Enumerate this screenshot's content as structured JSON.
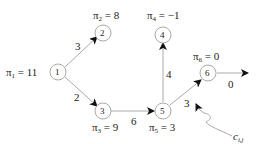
{
  "nodes": [
    {
      "id": "1",
      "label": "1",
      "potential": "π",
      "potential_sub": "1",
      "potential_value": "= 11"
    },
    {
      "id": "2",
      "label": "2",
      "potential": "π",
      "potential_sub": "2",
      "potential_value": "= 8"
    },
    {
      "id": "3",
      "label": "3",
      "potential": "π",
      "potential_sub": "3",
      "potential_value": "= 9"
    },
    {
      "id": "4",
      "label": "4",
      "potential": "π",
      "potential_sub": "4",
      "potential_value": "= −1"
    },
    {
      "id": "5",
      "label": "5",
      "potential": "π",
      "potential_sub": "5",
      "potential_value": "= 3"
    },
    {
      "id": "6",
      "label": "6",
      "potential": "π",
      "potential_sub": "6",
      "potential_value": "= 0"
    }
  ],
  "edges": [
    {
      "from": "1",
      "to": "2",
      "cost": "3"
    },
    {
      "from": "1",
      "to": "3",
      "cost": "2"
    },
    {
      "from": "3",
      "to": "5",
      "cost": "6"
    },
    {
      "from": "5",
      "to": "4",
      "cost": "4"
    },
    {
      "from": "5",
      "to": "6",
      "cost": "3"
    },
    {
      "from": "6",
      "to": "out",
      "cost": "0"
    }
  ],
  "annotation": {
    "text": "c",
    "sub": "i,j"
  }
}
